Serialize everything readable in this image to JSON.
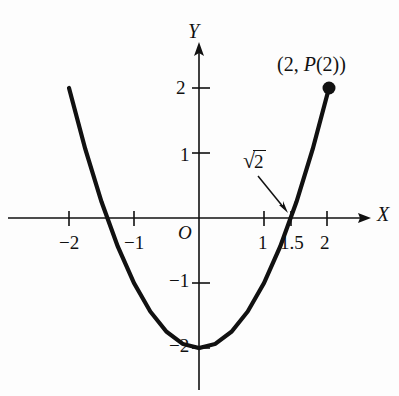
{
  "figure": {
    "background_color": "#fdfdfd",
    "ink_color": "#111111",
    "axes": {
      "x_axis_label": "X",
      "y_axis_label": "Y",
      "origin_label": "O"
    },
    "annotations": {
      "endpoint_label": "(2, P(2))",
      "endpoint_label_parts": {
        "open": "(2, ",
        "function_name": "P",
        "argument": "(2)",
        "close": ")"
      },
      "root_label": "√2",
      "root_radical_sign": "√",
      "root_radicand": "2"
    },
    "x_ticks": [
      {
        "value": -2,
        "label": "−2"
      },
      {
        "value": -1,
        "label": "−1"
      },
      {
        "value": 1,
        "label": "1"
      },
      {
        "value": 1.5,
        "label": "1.5"
      },
      {
        "value": 2,
        "label": "2"
      }
    ],
    "y_ticks": [
      {
        "value": 2,
        "label": "2"
      },
      {
        "value": 1,
        "label": "1"
      },
      {
        "value": -1,
        "label": "−1"
      },
      {
        "value": -2,
        "label": "−2"
      }
    ]
  },
  "chart_data": {
    "type": "line",
    "title": "",
    "xlabel": "X",
    "ylabel": "Y",
    "xlim": [
      -2.6,
      2.75
    ],
    "ylim": [
      -2.6,
      2.6
    ],
    "grid": false,
    "legend": null,
    "curve": {
      "name": "P(x) = x^2 - 2",
      "expression": "y = x^2 - 2",
      "domain": [
        -2,
        2
      ],
      "x": [
        -2,
        -1.75,
        -1.5,
        -1.25,
        -1,
        -0.75,
        -0.5,
        -0.25,
        0,
        0.25,
        0.5,
        0.75,
        1,
        1.25,
        1.5,
        1.75,
        2
      ],
      "y": [
        2,
        1.0625,
        0.25,
        -0.4375,
        -1,
        -1.4375,
        -1.75,
        -1.9375,
        -2,
        -1.9375,
        -1.75,
        -1.4375,
        -1,
        -0.4375,
        0.25,
        1.0625,
        2
      ]
    },
    "markers": [
      {
        "name": "endpoint",
        "x": 2,
        "y": 2,
        "style": "filled-circle",
        "label": "(2, P(2))"
      }
    ],
    "annotated_points": [
      {
        "name": "positive-root",
        "x": 1.414,
        "y": 0,
        "label": "√2"
      }
    ],
    "vertex": {
      "x": 0,
      "y": -2
    },
    "x_intercepts": [
      -1.414,
      1.414
    ],
    "xticks": [
      -2,
      -1,
      1,
      1.5,
      2
    ],
    "xticklabels": [
      "−2",
      "−1",
      "1",
      "1.5",
      "2"
    ],
    "yticks": [
      -2,
      -1,
      1,
      2
    ],
    "yticklabels": [
      "−2",
      "−1",
      "1",
      "2"
    ]
  }
}
